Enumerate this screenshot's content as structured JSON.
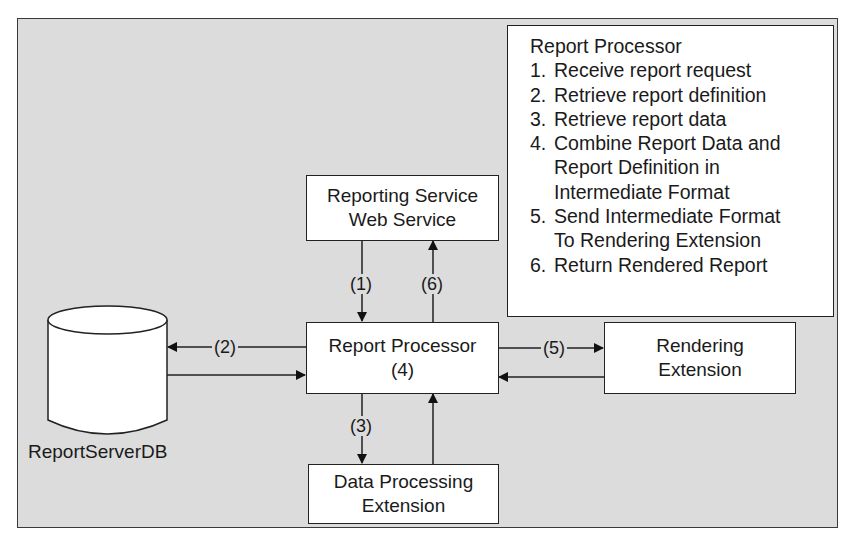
{
  "diagram": {
    "nodes": {
      "web_service": {
        "line1": "Reporting Service",
        "line2": "Web Service"
      },
      "report_processor": {
        "line1": "Report Processor",
        "line2": "(4)"
      },
      "rendering_extension": {
        "line1": "Rendering",
        "line2": "Extension"
      },
      "data_processing": {
        "line1": "Data Processing",
        "line2": "Extension"
      },
      "database": {
        "label": "ReportServerDB"
      }
    },
    "edge_labels": {
      "step1": "(1)",
      "step2": "(2)",
      "step3": "(3)",
      "step5": "(5)",
      "step6": "(6)"
    },
    "edges": [
      {
        "from": "Reporting Service Web Service",
        "to": "Report Processor",
        "label": "(1)"
      },
      {
        "from": "Report Processor",
        "to": "ReportServerDB",
        "label": "(2)"
      },
      {
        "from": "ReportServerDB",
        "to": "Report Processor",
        "label": ""
      },
      {
        "from": "Report Processor",
        "to": "Data Processing Extension",
        "label": "(3)"
      },
      {
        "from": "Data Processing Extension",
        "to": "Report Processor",
        "label": ""
      },
      {
        "from": "Report Processor",
        "to": "Rendering Extension",
        "label": "(5)"
      },
      {
        "from": "Rendering Extension",
        "to": "Report Processor",
        "label": ""
      },
      {
        "from": "Report Processor",
        "to": "Reporting Service Web Service",
        "label": "(6)"
      }
    ]
  },
  "legend_panel": {
    "title": "Report Processor",
    "steps": [
      {
        "num": "1.",
        "lines": [
          "Receive report request"
        ]
      },
      {
        "num": "2.",
        "lines": [
          "Retrieve report definition"
        ]
      },
      {
        "num": "3.",
        "lines": [
          "Retrieve report data"
        ]
      },
      {
        "num": "4.",
        "lines": [
          "Combine Report Data and",
          "Report Definition in",
          "Intermediate Format"
        ]
      },
      {
        "num": "5.",
        "lines": [
          "Send Intermediate Format",
          "To Rendering Extension"
        ]
      },
      {
        "num": "6.",
        "lines": [
          "Return Rendered Report"
        ]
      }
    ]
  },
  "colors": {
    "background": "#dcdcdc",
    "box_fill": "#ffffff",
    "stroke": "#222222"
  }
}
